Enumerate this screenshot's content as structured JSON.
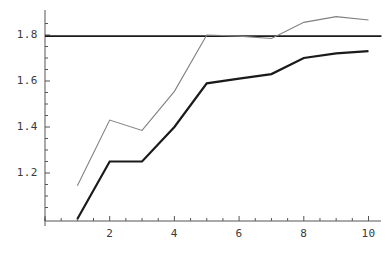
{
  "chart_data": {
    "type": "line",
    "title": "",
    "xlabel": "",
    "ylabel": "",
    "xlim": [
      0,
      10.4
    ],
    "ylim": [
      1.0,
      1.9
    ],
    "grid": false,
    "legend": null,
    "x": [
      1,
      2,
      3,
      4,
      5,
      6,
      7,
      8,
      9,
      10
    ],
    "x_ticks": [
      2,
      4,
      6,
      8,
      10
    ],
    "x_tick_labels": [
      "2",
      "4",
      "6",
      "8",
      "10"
    ],
    "x_minor_tick_count_between": 3,
    "y_ticks": [
      1.2,
      1.4,
      1.6,
      1.8
    ],
    "y_tick_labels": [
      "1.2",
      "1.4",
      "1.6",
      "1.8"
    ],
    "y_minor_tick_count_between": 3,
    "series": [
      {
        "name": "gray-curve",
        "color": "#808080",
        "width": 1.1,
        "values": [
          1.145,
          1.43,
          1.385,
          1.555,
          1.8,
          1.795,
          1.785,
          1.855,
          1.88,
          1.865
        ]
      },
      {
        "name": "dark-curve",
        "color": "#1a1a1a",
        "width": 2.2,
        "values": [
          1.0,
          1.25,
          1.25,
          1.4,
          1.59,
          1.61,
          1.63,
          1.7,
          1.72,
          1.73
        ]
      }
    ],
    "reference_line": {
      "name": "horizontal-reference-line",
      "orientation": "horizontal",
      "value": 1.795,
      "color": "#1a1a1a",
      "width": 1.6,
      "x_start": 0,
      "x_end": 10.4
    },
    "axis_color": "#555555"
  }
}
